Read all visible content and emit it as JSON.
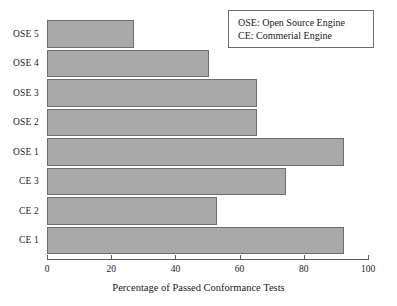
{
  "chart_data": {
    "type": "bar",
    "orientation": "horizontal",
    "title": "",
    "xlabel": "Percentage of Passed Conformance Tests",
    "ylabel": "",
    "xlim": [
      0,
      100
    ],
    "xticks": [
      0,
      20,
      40,
      60,
      80,
      100
    ],
    "xtick_labels": [
      "0",
      "20",
      "40",
      "60",
      "80",
      "100"
    ],
    "grid": false,
    "categories": [
      "CE 1",
      "CE 2",
      "CE 3",
      "OSE 1",
      "OSE 2",
      "OSE 3",
      "OSE 4",
      "OSE 5"
    ],
    "values": [
      92.5,
      53,
      74.5,
      92.5,
      65.5,
      65.5,
      50.5,
      27
    ],
    "categories_top_to_bottom": [
      "OSE 5",
      "OSE 4",
      "OSE 3",
      "OSE 2",
      "OSE 1",
      "CE 3",
      "CE 2",
      "CE 1"
    ],
    "values_top_to_bottom": [
      27,
      50.5,
      65.5,
      65.5,
      92.5,
      74.5,
      53,
      92.5
    ],
    "bars": [
      {
        "label": "OSE 5",
        "value": 27
      },
      {
        "label": "OSE 4",
        "value": 50.5
      },
      {
        "label": "OSE 3",
        "value": 65.5
      },
      {
        "label": "OSE 2",
        "value": 65.5
      },
      {
        "label": "OSE 1",
        "value": 92.5
      },
      {
        "label": "CE 3",
        "value": 74.5
      },
      {
        "label": "CE 2",
        "value": 53
      },
      {
        "label": "CE 1",
        "value": 92.5
      }
    ],
    "bar_fill_color": "#a9a9a9",
    "bar_edge_color": "#6d6d6d",
    "legend_position": "top-right",
    "legend_entries": [
      "OSE: Open Source Engine",
      "CE: Commerial Engine"
    ],
    "annotations": []
  },
  "legend": {
    "line1": "OSE: Open Source Engine",
    "line2": "CE: Commerial Engine"
  },
  "axis": {
    "x_title": "Percentage of Passed Conformance Tests",
    "tick_0": "0",
    "tick_20": "20",
    "tick_40": "40",
    "tick_60": "60",
    "tick_80": "80",
    "tick_100": "100"
  },
  "y_labels": {
    "l0": "OSE 5",
    "l1": "OSE 4",
    "l2": "OSE 3",
    "l3": "OSE 2",
    "l4": "OSE 1",
    "l5": "CE 3",
    "l6": "CE 2",
    "l7": "CE 1"
  }
}
